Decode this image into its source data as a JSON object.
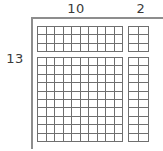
{
  "diagram": {
    "labels": {
      "top_left": "10",
      "top_right": "2",
      "left": "13"
    },
    "colors": {
      "grid_line": "#6f6f6f",
      "cell_fill": "#ffffff",
      "axis_line": "#8d8d8d",
      "label_text": "#3a3a3a",
      "background": "#ffffff"
    },
    "blocks": [
      {
        "name": "top-left",
        "columns": 10,
        "rows": 3,
        "cells": 30
      },
      {
        "name": "top-right",
        "columns": 2,
        "rows": 3,
        "cells": 6
      },
      {
        "name": "bottom-left",
        "columns": 10,
        "rows": 10,
        "cells": 100
      },
      {
        "name": "bottom-right",
        "columns": 2,
        "rows": 10,
        "cells": 20
      }
    ]
  },
  "chart_data": {
    "type": "table",
    "xlabel": "",
    "ylabel": "",
    "categories": [
      "10",
      "2"
    ],
    "row_categories": [
      "3",
      "10"
    ],
    "series": [
      {
        "name": "top row band (3 units tall)",
        "values": [
          30,
          6
        ]
      },
      {
        "name": "bottom row band (10 units tall)",
        "values": [
          100,
          20
        ]
      }
    ],
    "annotations": [
      {
        "text": "10",
        "position": "top-left-column-label"
      },
      {
        "text": "2",
        "position": "top-right-column-label"
      },
      {
        "text": "13",
        "position": "left-row-label"
      }
    ],
    "grid": true,
    "legend": "none"
  }
}
